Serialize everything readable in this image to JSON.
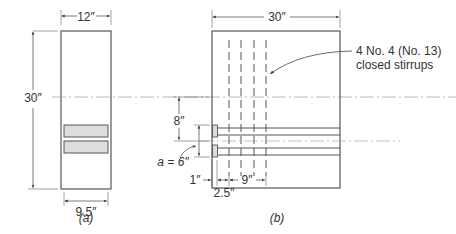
{
  "figure": {
    "panel_a": {
      "caption": "(a)",
      "dims": {
        "width_top": "12″",
        "height": "30″",
        "bar_width": "9.5″"
      }
    },
    "panel_b": {
      "caption": "(b)",
      "dims": {
        "length_top": "30″",
        "spacing_8": "8″",
        "a_label": "a = 6″",
        "cover_1": "1″",
        "first_stirrup": "2.5″",
        "stirrup_span": "9″"
      },
      "callout_line1": "4 No. 4 (No. 13)",
      "callout_line2": "closed stirrups"
    },
    "colors": {
      "line": "#555555",
      "bar_fill": "#dddddd",
      "centerline": "#999999"
    }
  }
}
